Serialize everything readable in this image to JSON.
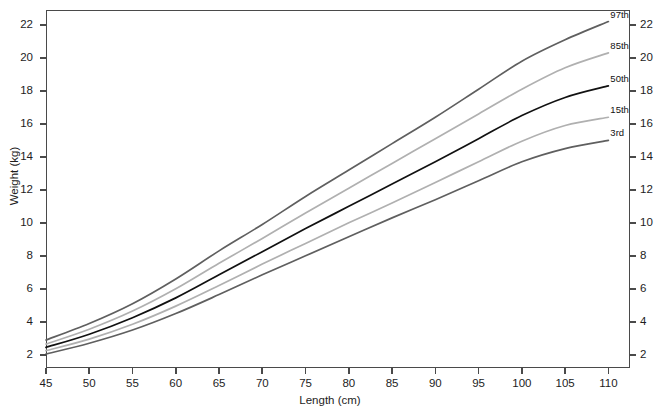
{
  "chart_data": {
    "type": "line",
    "title": "",
    "xlabel": "Length (cm)",
    "ylabel": "Weight (kg)",
    "xlim": [
      45,
      112.5
    ],
    "ylim": [
      1.2,
      22.9
    ],
    "grid": false,
    "legend_position": "right-inline",
    "xticks": [
      45,
      50,
      55,
      60,
      65,
      70,
      75,
      80,
      85,
      90,
      95,
      100,
      105,
      110
    ],
    "yticks": [
      2,
      4,
      6,
      8,
      10,
      12,
      14,
      16,
      18,
      20,
      22
    ],
    "right_axis_ticks": [
      2,
      4,
      6,
      8,
      10,
      12,
      14,
      16,
      18,
      20,
      22
    ],
    "x": [
      45,
      50,
      55,
      60,
      65,
      70,
      75,
      80,
      85,
      90,
      95,
      100,
      105,
      110
    ],
    "series": [
      {
        "name": "97th",
        "label": "97th",
        "color": "#5f5f5f",
        "width": 1.7,
        "values": [
          2.9,
          3.9,
          5.1,
          6.6,
          8.3,
          9.9,
          11.6,
          13.2,
          14.8,
          16.4,
          18.1,
          19.8,
          21.1,
          22.2
        ]
      },
      {
        "name": "85th",
        "label": "85th",
        "color": "#b0b0b0",
        "width": 1.7,
        "values": [
          2.65,
          3.55,
          4.65,
          6.0,
          7.55,
          9.05,
          10.6,
          12.1,
          13.6,
          15.1,
          16.6,
          18.1,
          19.4,
          20.3
        ]
      },
      {
        "name": "50th",
        "label": "50th",
        "color": "#111111",
        "width": 1.7,
        "values": [
          2.45,
          3.25,
          4.25,
          5.45,
          6.85,
          8.25,
          9.65,
          11.0,
          12.35,
          13.7,
          15.1,
          16.5,
          17.6,
          18.3
        ]
      },
      {
        "name": "15th",
        "label": "15th",
        "color": "#b0b0b0",
        "width": 1.7,
        "values": [
          2.25,
          2.95,
          3.85,
          4.95,
          6.2,
          7.5,
          8.75,
          10.0,
          11.2,
          12.45,
          13.7,
          14.95,
          15.9,
          16.4
        ]
      },
      {
        "name": "3rd",
        "label": "3rd",
        "color": "#5f5f5f",
        "width": 1.7,
        "values": [
          2.05,
          2.7,
          3.5,
          4.5,
          5.65,
          6.85,
          8.0,
          9.15,
          10.3,
          11.4,
          12.55,
          13.7,
          14.5,
          15.0
        ]
      }
    ]
  },
  "footer": {
    "note": ""
  }
}
